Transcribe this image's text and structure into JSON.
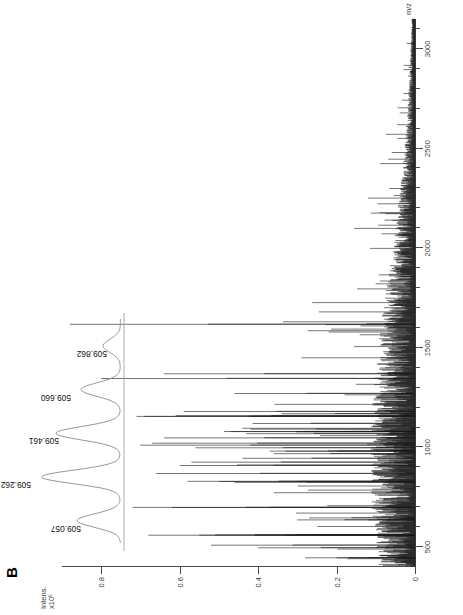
{
  "figure": {
    "panel_letter": "B",
    "type": "mass-spectrum"
  },
  "chart_data": {
    "type": "line",
    "title": "",
    "subtitle": "",
    "xlabel": "m/z",
    "ylabel": "Intens.",
    "ylabel_scale": "x10⁵",
    "xlim": [
      400,
      3150
    ],
    "ylim": [
      0,
      0.9
    ],
    "grid": false,
    "legend": "none",
    "x_ticks": [
      500,
      1000,
      1500,
      2000,
      2500,
      3000
    ],
    "x_tick_labels": [
      "500",
      "1000",
      "1500",
      "2000",
      "2500",
      "3000"
    ],
    "x_axis_suffix": "m/z",
    "y_ticks": [
      0,
      0.2,
      0.4,
      0.6,
      0.8
    ],
    "y_tick_labels": [
      "0",
      "0.2",
      "0.4",
      "0.6",
      "0.8"
    ],
    "annotated_peaks": [
      {
        "label": "445.119",
        "mz": 445.119,
        "intensity": 0.05
      },
      {
        "label": "446.119",
        "mz": 446.119,
        "intensity": 0.28
      },
      {
        "label": "446.120",
        "mz": 446.12,
        "intensity": 0.2
      },
      {
        "label": "496.120",
        "mz": 496.12,
        "intensity": 0.4
      },
      {
        "label": "636.327",
        "mz": 636.327,
        "intensity": 0.12
      },
      {
        "label": "636.327",
        "mz": 636.327,
        "intensity": 0.3
      },
      {
        "label": "646.326",
        "mz": 646.326,
        "intensity": 0.27
      },
      {
        "label": "698.598",
        "mz": 698.598,
        "intensity": 0.62
      },
      {
        "label": "699.265",
        "mz": 699.265,
        "intensity": 0.72
      },
      {
        "label": "824.651",
        "mz": 824.651,
        "intensity": 0.46
      },
      {
        "label": "828.927",
        "mz": 828.927,
        "intensity": 0.5
      },
      {
        "label": "830.201",
        "mz": 830.201,
        "intensity": 0.58
      },
      {
        "label": "869.120",
        "mz": 869.12,
        "intensity": 0.66
      },
      {
        "label": "909.256",
        "mz": 909.256,
        "intensity": 0.6
      },
      {
        "label": "925.709",
        "mz": 925.709,
        "intensity": 0.57
      },
      {
        "label": "945.257",
        "mz": 945.257,
        "intensity": 0.44
      },
      {
        "label": "968.347",
        "mz": 968.347,
        "intensity": 0.36
      },
      {
        "label": "981.258",
        "mz": 981.258,
        "intensity": 0.33
      },
      {
        "label": "981.597",
        "mz": 981.597,
        "intensity": 0.37
      },
      {
        "label": "998.178",
        "mz": 998.178,
        "intensity": 0.56
      },
      {
        "label": "1011.274",
        "mz": 1011.274,
        "intensity": 0.7
      },
      {
        "label": "1021.171",
        "mz": 1021.171,
        "intensity": 0.67
      },
      {
        "label": "1048.010",
        "mz": 1048.01,
        "intensity": 0.64
      },
      {
        "label": "1069.181",
        "mz": 1069.181,
        "intensity": 0.43
      },
      {
        "label": "1079.264",
        "mz": 1079.264,
        "intensity": 0.3
      },
      {
        "label": "1079.282",
        "mz": 1079.282,
        "intensity": 0.26
      },
      {
        "label": "1079.330",
        "mz": 1079.33,
        "intensity": 0.47
      },
      {
        "label": "1091.385",
        "mz": 1091.385,
        "intensity": 0.42
      },
      {
        "label": "1155.594",
        "mz": 1155.594,
        "intensity": 0.69
      },
      {
        "label": "1155.568",
        "mz": 1155.568,
        "intensity": 0.71
      },
      {
        "label": "1159.722",
        "mz": 1159.722,
        "intensity": 0.61
      },
      {
        "label": "1169.325",
        "mz": 1169.325,
        "intensity": 0.34
      },
      {
        "label": "1180.274",
        "mz": 1180.274,
        "intensity": 0.59
      },
      {
        "label": "1270.623",
        "mz": 1270.623,
        "intensity": 0.46
      },
      {
        "label": "1346.159",
        "mz": 1346.159,
        "intensity": 0.8
      },
      {
        "label": "1369.392",
        "mz": 1369.392,
        "intensity": 0.64
      },
      {
        "label": "1617.995",
        "mz": 1617.995,
        "intensity": 0.88
      },
      {
        "label": "509.587",
        "mz": 509.587,
        "intensity": 0.52
      },
      {
        "label": "559.650",
        "mz": 559.65,
        "intensity": 0.68
      },
      {
        "label": "559.650",
        "mz": 559.65,
        "intensity": 0.55
      },
      {
        "label": "561.094",
        "mz": 561.094,
        "intensity": 0.51
      },
      {
        "label": "561.094",
        "mz": 561.094,
        "intensity": 0.41
      }
    ],
    "inset": {
      "type": "line",
      "description": "isotope cluster",
      "labels": [
        "509.057",
        "509.262",
        "509.461",
        "509.660",
        "509.862"
      ],
      "mz_values": [
        509.057,
        509.262,
        509.461,
        509.66,
        509.862
      ],
      "relative_intensities": [
        0.55,
        1.0,
        0.82,
        0.5,
        0.22
      ]
    }
  }
}
